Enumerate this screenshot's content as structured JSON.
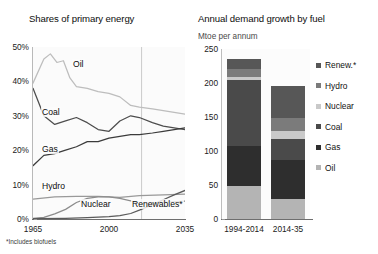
{
  "left_chart": {
    "title": "Shares of primary energy",
    "footnote": "*Includes biofuels",
    "y_ticks": [
      "50%",
      "40%",
      "30%",
      "20%",
      "10%",
      "0%"
    ],
    "x_ticks": [
      "1965",
      "2000",
      "2035"
    ],
    "series_labels": {
      "oil": "Oil",
      "coal": "Coal",
      "gas": "Gas",
      "hydro": "Hydro",
      "nuclear": "Nuclear",
      "renewables": "Renewables*"
    }
  },
  "right_chart": {
    "title": "Annual demand growth by fuel",
    "subtitle": "Mtoe per annum",
    "y_ticks": [
      "250",
      "200",
      "150",
      "100",
      "50",
      "0"
    ],
    "x_ticks": [
      "1994-2014",
      "2014-35"
    ],
    "legend": [
      {
        "label": "Renew.*",
        "color": "#575757"
      },
      {
        "label": "Hydro",
        "color": "#7b7b7b"
      },
      {
        "label": "Nuclear",
        "color": "#c9c9c9"
      },
      {
        "label": "Coal",
        "color": "#4a4a4a"
      },
      {
        "label": "Gas",
        "color": "#2e2e2e"
      },
      {
        "label": "Oil",
        "color": "#b4b4b4"
      }
    ]
  },
  "chart_data": [
    {
      "type": "line",
      "title": "Shares of primary energy",
      "xlabel": "",
      "ylabel": "Share of primary energy (%)",
      "xlim": [
        1965,
        2035
      ],
      "ylim": [
        0,
        50
      ],
      "y_ticks": [
        0,
        10,
        20,
        30,
        40,
        50
      ],
      "x_ticks": [
        1965,
        2000,
        2035
      ],
      "grid": false,
      "annotations": [
        "*Includes biofuels"
      ],
      "forecast_divider_x": 2015,
      "series": [
        {
          "name": "Oil",
          "color": "#bdbdbd",
          "x": [
            1965,
            1970,
            1973,
            1976,
            1979,
            1982,
            1985,
            1990,
            1995,
            2000,
            2005,
            2010,
            2014,
            2020,
            2025,
            2030,
            2035
          ],
          "values": [
            39.5,
            46.5,
            48.0,
            45.5,
            46.0,
            41.0,
            38.5,
            38.0,
            37.0,
            36.5,
            35.5,
            33.0,
            32.5,
            32.0,
            31.5,
            31.0,
            30.5
          ]
        },
        {
          "name": "Coal",
          "color": "#4d4d4d",
          "x": [
            1965,
            1970,
            1975,
            1980,
            1985,
            1990,
            1995,
            2000,
            2005,
            2010,
            2014,
            2020,
            2025,
            2030,
            2035
          ],
          "values": [
            38.0,
            30.0,
            27.5,
            28.5,
            29.5,
            28.0,
            26.0,
            25.5,
            28.5,
            30.0,
            29.5,
            28.0,
            27.0,
            26.5,
            26.0
          ]
        },
        {
          "name": "Gas",
          "color": "#3b3b3b",
          "x": [
            1965,
            1970,
            1975,
            1980,
            1985,
            1990,
            1995,
            2000,
            2005,
            2010,
            2014,
            2020,
            2025,
            2030,
            2035
          ],
          "values": [
            15.5,
            18.5,
            19.0,
            20.0,
            21.0,
            22.5,
            22.5,
            23.5,
            24.0,
            24.5,
            24.5,
            25.0,
            25.5,
            26.0,
            26.5
          ]
        },
        {
          "name": "Hydro",
          "color": "#999999",
          "x": [
            1965,
            1975,
            1985,
            1995,
            2005,
            2014,
            2025,
            2035
          ],
          "values": [
            5.8,
            6.4,
            6.6,
            6.6,
            6.3,
            6.8,
            7.0,
            7.2
          ]
        },
        {
          "name": "Nuclear",
          "color": "#8c8c8c",
          "x": [
            1965,
            1970,
            1975,
            1980,
            1985,
            1990,
            1995,
            2000,
            2005,
            2010,
            2014,
            2025,
            2035
          ],
          "values": [
            0.2,
            0.5,
            1.5,
            2.8,
            4.8,
            6.0,
            6.4,
            6.4,
            6.0,
            5.3,
            4.4,
            4.8,
            5.2
          ]
        },
        {
          "name": "Renewables*",
          "color": "#5a5a5a",
          "x": [
            1965,
            1980,
            1990,
            2000,
            2005,
            2010,
            2014,
            2020,
            2025,
            2030,
            2035
          ],
          "values": [
            0.1,
            0.2,
            0.4,
            0.7,
            1.0,
            1.6,
            2.6,
            4.2,
            5.6,
            7.0,
            8.3
          ]
        }
      ]
    },
    {
      "type": "bar",
      "stacked": true,
      "title": "Annual demand growth by fuel",
      "subtitle": "Mtoe per annum",
      "xlabel": "",
      "ylabel": "Mtoe per annum",
      "ylim": [
        0,
        250
      ],
      "y_ticks": [
        0,
        50,
        100,
        150,
        200,
        250
      ],
      "categories": [
        "1994-2014",
        "2014-35"
      ],
      "grid": false,
      "legend_position": "right",
      "series": [
        {
          "name": "Oil",
          "color": "#b4b4b4",
          "values": [
            48,
            30
          ]
        },
        {
          "name": "Gas",
          "color": "#2e2e2e",
          "values": [
            59,
            57
          ]
        },
        {
          "name": "Coal",
          "color": "#4a4a4a",
          "values": [
            98,
            31
          ]
        },
        {
          "name": "Nuclear",
          "color": "#c9c9c9",
          "values": [
            4,
            11
          ]
        },
        {
          "name": "Hydro",
          "color": "#7b7b7b",
          "values": [
            11,
            19
          ]
        },
        {
          "name": "Renew.*",
          "color": "#575757",
          "values": [
            15,
            47
          ]
        }
      ],
      "totals": [
        235,
        195
      ]
    }
  ]
}
